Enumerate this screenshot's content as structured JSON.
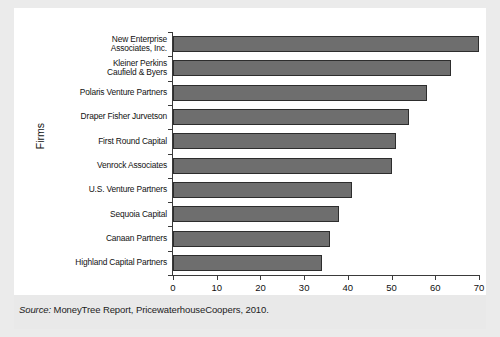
{
  "figure": {
    "background_color": "#ebebeb",
    "card_color": "#ffffff",
    "bar_fill_color": "#6e6e6e",
    "bar_edge_color": "#2d2d2d",
    "axis_color": "#3a3a3a"
  },
  "source": {
    "label": "Source:",
    "text": " MoneyTree Report, PricewaterhouseCoopers, 2010."
  },
  "chart_data": {
    "type": "bar",
    "orientation": "horizontal",
    "title": "",
    "xlabel": "Deals Completed",
    "ylabel": "Firms",
    "xlim": [
      0,
      70
    ],
    "xticks": [
      0,
      10,
      20,
      30,
      40,
      50,
      60,
      70
    ],
    "xtick_labels": [
      "0",
      "10",
      "20",
      "30",
      "40",
      "50",
      "60",
      "70"
    ],
    "grid": false,
    "legend": false,
    "categories": [
      "New Enterprise\nAssociates, Inc.",
      "Kleiner Perkins\nCaufield & Byers",
      "Polaris Venture Partners",
      "Draper Fisher Jurvetson",
      "First Round Capital",
      "Venrock Associates",
      "U.S. Venture Partners",
      "Sequoia Capital",
      "Canaan Partners",
      "Highland Capital Partners"
    ],
    "values": [
      70,
      63.5,
      58,
      54,
      51,
      50,
      41,
      38,
      36,
      34
    ]
  }
}
